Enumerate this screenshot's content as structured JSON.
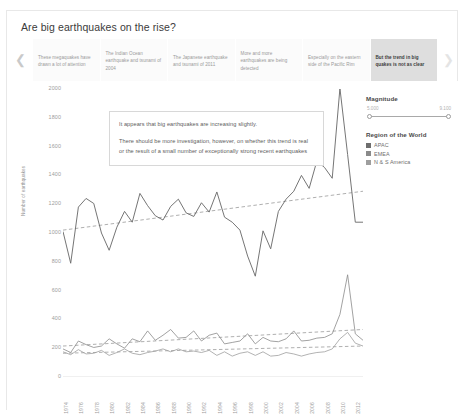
{
  "story": {
    "title": "Are big earthquakes on the rise?",
    "nav": {
      "prev_icon": "chevron-left-icon",
      "next_icon": "chevron-right-icon"
    },
    "tabs": [
      {
        "label": "These megaquakes have drawn a lot of attention",
        "active": false
      },
      {
        "label": "The Indian Ocean earthquake and tsunami of 2004",
        "active": false
      },
      {
        "label": "The Japanese earthquake and tsunami of 2011",
        "active": false
      },
      {
        "label": "More and more earthquakes are being detected",
        "active": false
      },
      {
        "label": "Especially on the eastern side of the Pacific Rim",
        "active": false
      },
      {
        "label": "But the trend in big quakes is not as clear",
        "active": true
      }
    ]
  },
  "annotation": {
    "paragraph_1": "It appears that big earthquakes are increasing slightly.",
    "paragraph_2": "There should be more investigation, however, on whether this trend is real or the result of a small number of exceptionally strong recent earthquakes"
  },
  "legend": {
    "magnitude": {
      "title": "Magnitude",
      "min_label": "5.000",
      "max_label": "9.100"
    },
    "region": {
      "title": "Region of the World",
      "items": [
        {
          "label": "APAC",
          "color": "#6e6e6e"
        },
        {
          "label": "EMEA",
          "color": "#8a8a8a"
        },
        {
          "label": "N & S America",
          "color": "#9e9e9e"
        }
      ]
    }
  },
  "chart_data": {
    "type": "line",
    "title": "",
    "xlabel": "",
    "ylabel": "Number of earthquakes",
    "ylim": [
      0,
      2000
    ],
    "yticks": [
      2000,
      1800,
      1600,
      1400,
      1200,
      1000,
      800,
      600,
      400,
      200,
      0
    ],
    "grid": false,
    "legend_position": "right",
    "x": [
      1974,
      1975,
      1976,
      1977,
      1978,
      1979,
      1980,
      1981,
      1982,
      1983,
      1984,
      1985,
      1986,
      1987,
      1988,
      1989,
      1990,
      1991,
      1992,
      1993,
      1994,
      1995,
      1996,
      1997,
      1998,
      1999,
      2000,
      2001,
      2002,
      2003,
      2004,
      2005,
      2006,
      2007,
      2008,
      2009,
      2010,
      2011,
      2012,
      2013
    ],
    "xticks": [
      "1974",
      "1976",
      "1978",
      "1980",
      "1982",
      "1984",
      "1986",
      "1988",
      "1990",
      "1992",
      "1994",
      "1996",
      "1998",
      "2000",
      "2002",
      "2004",
      "2006",
      "2008",
      "2010",
      "2012"
    ],
    "series": [
      {
        "name": "APAC",
        "kind": "total-line",
        "values": [
          1010,
          790,
          1180,
          1240,
          1205,
          1000,
          880,
          1040,
          1150,
          1075,
          1275,
          1190,
          1120,
          1090,
          1185,
          1235,
          1140,
          1115,
          1210,
          1145,
          1285,
          1110,
          1075,
          1020,
          840,
          700,
          1015,
          890,
          1150,
          1235,
          1290,
          1400,
          1310,
          1500,
          1455,
          1380,
          2005,
          1545,
          1075,
          1075
        ]
      },
      {
        "name": "EMEA",
        "kind": "lower-line",
        "values": [
          195,
          170,
          250,
          225,
          205,
          215,
          265,
          230,
          200,
          265,
          245,
          320,
          255,
          290,
          330,
          270,
          275,
          320,
          250,
          290,
          305,
          230,
          240,
          250,
          300,
          230,
          275,
          250,
          245,
          265,
          320,
          250,
          255,
          270,
          275,
          300,
          435,
          710,
          300,
          255
        ]
      },
      {
        "name": "N & S America",
        "kind": "lower-line",
        "values": [
          175,
          155,
          190,
          160,
          165,
          185,
          150,
          170,
          195,
          165,
          155,
          170,
          180,
          195,
          175,
          195,
          175,
          180,
          170,
          185,
          150,
          175,
          145,
          165,
          175,
          150,
          175,
          145,
          150,
          170,
          160,
          145,
          160,
          170,
          175,
          195,
          265,
          310,
          235,
          215
        ]
      }
    ],
    "trendlines": [
      {
        "name": "total-trend",
        "y_start": 1020,
        "y_end": 1290,
        "style": "dashed"
      },
      {
        "name": "emea-trend",
        "y_start": 215,
        "y_end": 330,
        "style": "dashed"
      },
      {
        "name": "americas-trend",
        "y_start": 165,
        "y_end": 215,
        "style": "dashed"
      }
    ]
  }
}
